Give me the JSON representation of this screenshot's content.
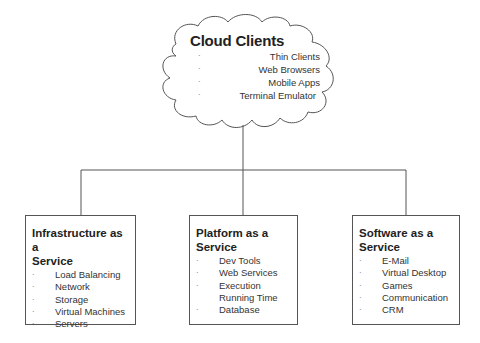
{
  "cloud": {
    "title": "Cloud Clients",
    "bullet": "·",
    "items": [
      "Thin Clients",
      "Web Browsers",
      "Mobile Apps",
      "Terminal Emulator"
    ]
  },
  "boxes": [
    {
      "title_line1": "Infrastructure as a",
      "title_line2": "Service",
      "items": [
        "Load Balancing",
        "Network",
        "Storage",
        "Virtual Machines",
        "Servers"
      ]
    },
    {
      "title_line1": "Platform as a",
      "title_line2": "Service",
      "items": [
        "Dev Tools",
        "Web Services",
        "Execution Running Time",
        "Database"
      ]
    },
    {
      "title_line1": "Software as a",
      "title_line2": "Service",
      "items": [
        "E-Mail",
        "Virtual Desktop",
        "Games",
        "Communication",
        "CRM"
      ]
    }
  ],
  "bullet": "·",
  "colors": {
    "line": "#555555",
    "text": "#222222",
    "background": "#ffffff"
  }
}
